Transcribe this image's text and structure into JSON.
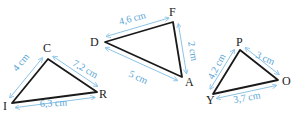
{
  "colors": {
    "triangle_stroke": "#1a1a1a",
    "measure_color": "#5aa6d6",
    "label_color": "#222222",
    "background": "#ffffff"
  },
  "triangles": [
    {
      "name": "CIR",
      "vertices": [
        {
          "label": "C",
          "x": 48,
          "y": 59,
          "lx": 43,
          "ly": 52
        },
        {
          "label": "I",
          "x": 12,
          "y": 103,
          "lx": 3,
          "ly": 110
        },
        {
          "label": "R",
          "x": 97,
          "y": 92,
          "lx": 99,
          "ly": 98
        }
      ],
      "sides": [
        {
          "label": "4 cm",
          "from": "I",
          "to": "C",
          "tx": 17,
          "ty": 72,
          "rot": -50
        },
        {
          "label": "7,2 cm",
          "from": "C",
          "to": "R",
          "tx": 72,
          "ty": 65,
          "rot": 30
        },
        {
          "label": "6,3 cm",
          "from": "I",
          "to": "R",
          "tx": 40,
          "ty": 107,
          "rot": -3
        }
      ]
    },
    {
      "name": "DFA",
      "vertices": [
        {
          "label": "D",
          "x": 105,
          "y": 42,
          "lx": 90,
          "ly": 46
        },
        {
          "label": "F",
          "x": 173,
          "y": 22,
          "lx": 169,
          "ly": 16
        },
        {
          "label": "A",
          "x": 182,
          "y": 77,
          "lx": 185,
          "ly": 86
        }
      ],
      "sides": [
        {
          "label": "4,6 cm",
          "from": "D",
          "to": "F",
          "tx": 120,
          "ty": 25,
          "rot": -15
        },
        {
          "label": "2 cm",
          "from": "F",
          "to": "A",
          "tx": 188,
          "ty": 42,
          "rot": 80
        },
        {
          "label": "5 cm",
          "from": "D",
          "to": "A",
          "tx": 128,
          "ty": 76,
          "rot": 25
        }
      ]
    },
    {
      "name": "PYO",
      "vertices": [
        {
          "label": "P",
          "x": 240,
          "y": 50,
          "lx": 236,
          "ly": 46
        },
        {
          "label": "Y",
          "x": 213,
          "y": 94,
          "lx": 206,
          "ly": 104
        },
        {
          "label": "O",
          "x": 278,
          "y": 80,
          "lx": 282,
          "ly": 85
        }
      ],
      "sides": [
        {
          "label": "4,2 cm",
          "from": "Y",
          "to": "P",
          "tx": 213,
          "ty": 80,
          "rot": -62
        },
        {
          "label": "3 cm",
          "from": "P",
          "to": "O",
          "tx": 255,
          "ty": 57,
          "rot": 25
        },
        {
          "label": "3,7 cm",
          "from": "Y",
          "to": "O",
          "tx": 234,
          "ty": 103,
          "rot": -10
        }
      ]
    }
  ]
}
